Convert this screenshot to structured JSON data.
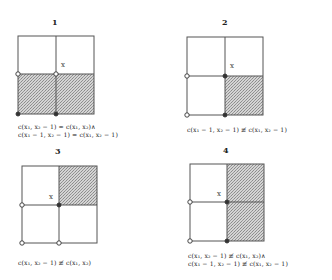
{
  "panels": [
    {
      "label": "1",
      "grid": {
        "left": 18,
        "top": 36,
        "midx": 56,
        "midy": 74,
        "right": 94,
        "bottom": 114
      },
      "shaded": [
        "bottom-left",
        "bottom-right"
      ],
      "x_marker": {
        "text": "x",
        "x": 61,
        "y": 63
      },
      "markers": [
        {
          "pos": "mid-left",
          "type": "hollow"
        },
        {
          "pos": "center",
          "type": "hollow"
        },
        {
          "pos": "bottom-left",
          "type": "filled"
        },
        {
          "pos": "bottom-mid",
          "type": "filled"
        }
      ],
      "caption": [
        "c(x₁, x₂ − 1) = c(x₁, x₂)∧",
        "c(x₁ − 1, x₂ − 1) = c(x₁, x₂ − 1)"
      ]
    },
    {
      "label": "2",
      "grid": {
        "left": 187,
        "top": 37,
        "midx": 225,
        "midy": 76,
        "right": 263,
        "bottom": 115
      },
      "shaded": [
        "bottom-right"
      ],
      "x_marker": {
        "text": "x",
        "x": 230,
        "y": 64
      },
      "markers": [
        {
          "pos": "mid-left",
          "type": "hollow"
        },
        {
          "pos": "center",
          "type": "filled"
        },
        {
          "pos": "bottom-left",
          "type": "hollow"
        },
        {
          "pos": "bottom-mid",
          "type": "filled"
        }
      ],
      "caption": [
        "c(x₁ − 1, x₂ − 1) ≢ c(x₁, x₂ − 1)"
      ]
    },
    {
      "label": "3",
      "grid": {
        "left": 22,
        "top": 166,
        "midx": 59,
        "midy": 205,
        "right": 97,
        "bottom": 243
      },
      "shaded": [
        "top-right"
      ],
      "x_marker": {
        "text": "x",
        "x": 49,
        "y": 195
      },
      "markers": [
        {
          "pos": "mid-left",
          "type": "hollow"
        },
        {
          "pos": "center",
          "type": "filled"
        },
        {
          "pos": "bottom-left",
          "type": "hollow"
        },
        {
          "pos": "bottom-mid",
          "type": "hollow"
        }
      ],
      "caption": [
        "c(x₁, x₂ − 1) ≢ c(x₁, x₂)"
      ]
    },
    {
      "label": "4",
      "grid": {
        "left": 190,
        "top": 164,
        "midx": 227,
        "midy": 202,
        "right": 264,
        "bottom": 241
      },
      "shaded": [
        "top-right",
        "bottom-right"
      ],
      "x_marker": {
        "text": "x",
        "x": 217,
        "y": 192
      },
      "markers": [
        {
          "pos": "mid-left",
          "type": "hollow"
        },
        {
          "pos": "center",
          "type": "filled"
        },
        {
          "pos": "bottom-left",
          "type": "hollow"
        },
        {
          "pos": "bottom-mid",
          "type": "filled"
        }
      ],
      "caption": [
        "c(x₁, x₂ − 1) ≢ c(x₁, x₂)∧",
        "c(x₁ − 1, x₂ − 1) ≢ c(x₁, x₂ − 1)"
      ]
    }
  ],
  "colors": {
    "line": "#555555",
    "shade": "#bdbdbd",
    "marker": "#333333"
  }
}
